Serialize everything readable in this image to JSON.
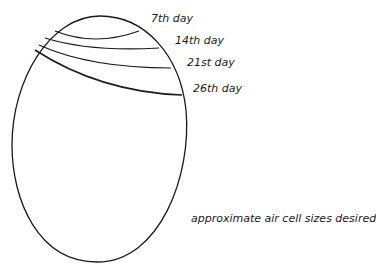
{
  "figure": {
    "title": "approximate air cell sizes desired",
    "labels": [
      {
        "text": "7th day",
        "x": 151,
        "y": 12
      },
      {
        "text": "14th day",
        "x": 175,
        "y": 34
      },
      {
        "text": "21st day",
        "x": 187,
        "y": 56
      },
      {
        "text": "26th day",
        "x": 193,
        "y": 82
      }
    ],
    "caption": "approximate air cell sizes desired",
    "line_color": "#1a1a1a"
  }
}
